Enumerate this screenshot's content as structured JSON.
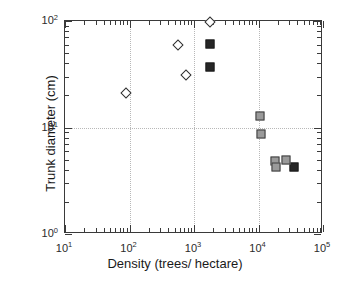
{
  "chart_data": {
    "type": "scatter",
    "title": "",
    "xlabel": "Density (trees/ hectare)",
    "ylabel": "Trunk diameter (cm)",
    "xscale": "log",
    "yscale": "log",
    "xlim": [
      10,
      100000
    ],
    "ylim": [
      1,
      100
    ],
    "grid": "dotted gridlines at x = 1e2, 1e3, 1e4 and y = 1e1",
    "legend": "none",
    "xticks": [
      {
        "value": 10,
        "label": "10",
        "exp": "1"
      },
      {
        "value": 100,
        "label": "10",
        "exp": "2"
      },
      {
        "value": 1000,
        "label": "10",
        "exp": "3"
      },
      {
        "value": 10000,
        "label": "10",
        "exp": "4"
      },
      {
        "value": 100000,
        "label": "10",
        "exp": "5"
      }
    ],
    "yticks": [
      {
        "value": 1,
        "label": "10",
        "exp": "0"
      },
      {
        "value": 10,
        "label": "10",
        "exp": "1"
      },
      {
        "value": 100,
        "label": "10",
        "exp": "2"
      }
    ],
    "series": [
      {
        "name": "open-diamond",
        "marker": "open diamond",
        "fill": "#ffffff",
        "edge": "#2e2e2e",
        "points": [
          {
            "x": 88,
            "y": 21
          },
          {
            "x": 560,
            "y": 60
          },
          {
            "x": 760,
            "y": 31
          },
          {
            "x": 1750,
            "y": 97
          }
        ]
      },
      {
        "name": "filled-dark-square",
        "marker": "filled square",
        "fill": "#262626",
        "edge": "#1a1a1a",
        "points": [
          {
            "x": 1800,
            "y": 61
          },
          {
            "x": 1800,
            "y": 37
          },
          {
            "x": 35000,
            "y": 4.3
          }
        ]
      },
      {
        "name": "gray-square",
        "marker": "gray filled square",
        "fill": "#9a9a9a",
        "edge": "#3d3d3d",
        "points": [
          {
            "x": 10500,
            "y": 12.8
          },
          {
            "x": 10800,
            "y": 8.6
          },
          {
            "x": 18000,
            "y": 4.8
          },
          {
            "x": 18500,
            "y": 4.3
          },
          {
            "x": 27000,
            "y": 5.0
          }
        ]
      }
    ]
  },
  "colors": {
    "axis": "#3a3a3a",
    "grid": "#b8b8b8",
    "text": "#1a1a1a",
    "background": "#ffffff"
  }
}
